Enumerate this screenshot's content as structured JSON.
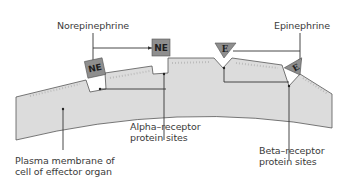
{
  "diagram": {
    "type": "receptor-binding-schematic",
    "labels": {
      "norepinephrine": "Norepinephrine",
      "epinephrine": "Epinephrine",
      "alpha_line1": "Alpha–receptor",
      "alpha_line2": "protein sites",
      "beta_line1": "Beta–receptor",
      "beta_line2": "protein sites",
      "membrane_line1": "Plasma membrane of",
      "membrane_line2": "cell of effector organ"
    },
    "molecules": {
      "ne_symbol": "NE",
      "e_symbol": "E"
    },
    "colors": {
      "membrane_fill": "#dcdcdc",
      "membrane_stroke": "#555555",
      "molecule_fill": "#8e8e8e",
      "line": "#333333",
      "text": "#3a3a3a"
    }
  }
}
